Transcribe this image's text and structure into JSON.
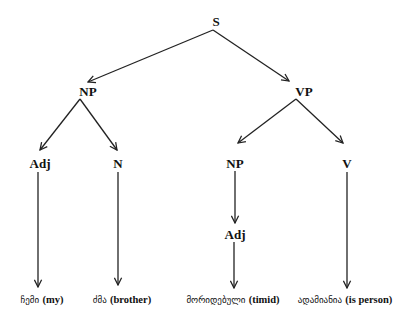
{
  "diagram": {
    "type": "syntax-tree",
    "nodes": {
      "s": {
        "label": "S",
        "x": 216,
        "y": 21
      },
      "np": {
        "label": "NP",
        "x": 88,
        "y": 91
      },
      "vp": {
        "label": "VP",
        "x": 304,
        "y": 91
      },
      "adj1": {
        "label": "Adj",
        "x": 40,
        "y": 163
      },
      "n": {
        "label": "N",
        "x": 118,
        "y": 163
      },
      "np2": {
        "label": "NP",
        "x": 235,
        "y": 163
      },
      "v": {
        "label": "V",
        "x": 347,
        "y": 163
      },
      "adj2": {
        "label": "Adj",
        "x": 235,
        "y": 234
      }
    },
    "leaves": [
      {
        "georgian": "ჩემი",
        "gloss": "(my)",
        "x": 40,
        "y": 300
      },
      {
        "georgian": "ძმა",
        "gloss": "(brother)",
        "x": 120,
        "y": 300
      },
      {
        "georgian": "მორიდებული",
        "gloss": "(timid)",
        "x": 233,
        "y": 300
      },
      {
        "georgian": "ადამიანია",
        "gloss": "(is person)",
        "x": 346,
        "y": 300
      }
    ],
    "edges": [
      {
        "from": "S",
        "to": "NP"
      },
      {
        "from": "S",
        "to": "VP"
      },
      {
        "from": "NP",
        "to": "Adj"
      },
      {
        "from": "NP",
        "to": "N"
      },
      {
        "from": "VP",
        "to": "NP"
      },
      {
        "from": "VP",
        "to": "V"
      },
      {
        "from": "NP",
        "to": "Adj"
      },
      {
        "from": "Adj",
        "to": "ჩემი (my)"
      },
      {
        "from": "N",
        "to": "ძმა (brother)"
      },
      {
        "from": "Adj",
        "to": "მორიდებული (timid)"
      },
      {
        "from": "V",
        "to": "ადამიანია (is person)"
      }
    ],
    "line_color": "#222222"
  }
}
